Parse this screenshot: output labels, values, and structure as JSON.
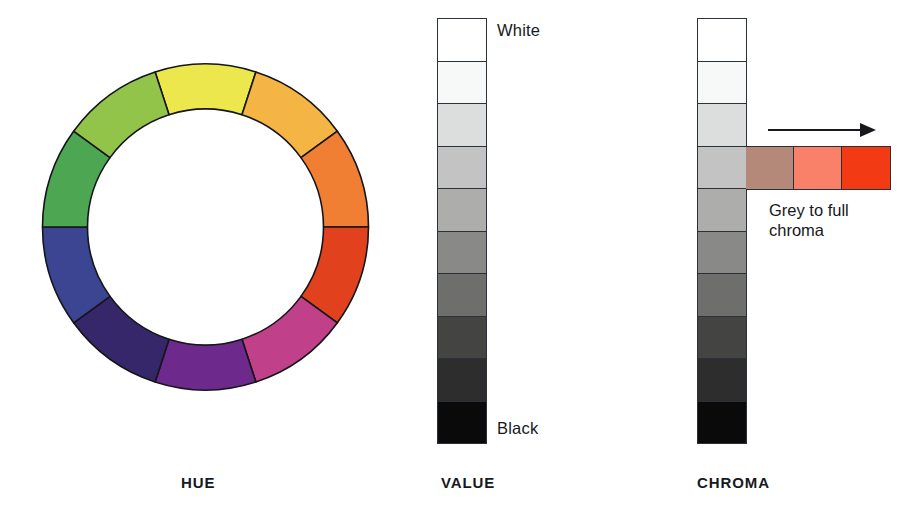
{
  "figure": {
    "panels": [
      {
        "key": "hue",
        "label": "HUE"
      },
      {
        "key": "value",
        "label": "VALUE"
      },
      {
        "key": "chroma",
        "label": "CHROMA"
      }
    ]
  },
  "hue": {
    "label": "HUE",
    "segment_count": 10,
    "outer_radius": 163,
    "inner_radius": 118,
    "stroke": "#15161a",
    "segments": [
      {
        "name": "yellow",
        "color": "#ece74c",
        "start_deg": -18,
        "end_deg": 18
      },
      {
        "name": "yellow-orange",
        "color": "#f5b545",
        "start_deg": 18,
        "end_deg": 54
      },
      {
        "name": "orange",
        "color": "#f07f34",
        "start_deg": 54,
        "end_deg": 90
      },
      {
        "name": "red-orange",
        "color": "#e2411d",
        "start_deg": 90,
        "end_deg": 126
      },
      {
        "name": "magenta",
        "color": "#c0408a",
        "start_deg": 126,
        "end_deg": 162
      },
      {
        "name": "violet",
        "color": "#6d2a8c",
        "start_deg": 162,
        "end_deg": 198
      },
      {
        "name": "blue-violet",
        "color": "#352769",
        "start_deg": 198,
        "end_deg": 234
      },
      {
        "name": "blue",
        "color": "#3b4591",
        "start_deg": 234,
        "end_deg": 270
      },
      {
        "name": "green",
        "color": "#4da651",
        "start_deg": 270,
        "end_deg": 306
      },
      {
        "name": "yellow-green",
        "color": "#92c44a",
        "start_deg": 306,
        "end_deg": 342
      }
    ]
  },
  "value": {
    "label": "VALUE",
    "top_label": "White",
    "bottom_label": "Black",
    "step_count": 10,
    "steps": [
      {
        "name": "step-1-white",
        "color": "#ffffff"
      },
      {
        "name": "step-2",
        "color": "#f7f8f8"
      },
      {
        "name": "step-3",
        "color": "#dcdddd"
      },
      {
        "name": "step-4",
        "color": "#c2c3c2"
      },
      {
        "name": "step-5",
        "color": "#adaeac"
      },
      {
        "name": "step-6",
        "color": "#898a88"
      },
      {
        "name": "step-7",
        "color": "#6e6f6d"
      },
      {
        "name": "step-8",
        "color": "#444543"
      },
      {
        "name": "step-9",
        "color": "#2c2d2c"
      },
      {
        "name": "step-10-black",
        "color": "#0a0a0a"
      }
    ]
  },
  "chroma": {
    "label": "CHROMA",
    "caption": "Grey to full chroma",
    "arrow": "right-arrow",
    "step_count": 10,
    "strip_row_index": 4,
    "steps": [
      {
        "name": "step-1-white",
        "color": "#ffffff"
      },
      {
        "name": "step-2",
        "color": "#f7f8f8"
      },
      {
        "name": "step-3",
        "color": "#dcdddd"
      },
      {
        "name": "step-4",
        "color": "#c2c3c2"
      },
      {
        "name": "step-5",
        "color": "#adaeac"
      },
      {
        "name": "step-6",
        "color": "#898a88"
      },
      {
        "name": "step-7",
        "color": "#6e6f6d"
      },
      {
        "name": "step-8",
        "color": "#444543"
      },
      {
        "name": "step-9",
        "color": "#2c2d2c"
      },
      {
        "name": "step-10-black",
        "color": "#0a0a0a"
      }
    ],
    "strip": [
      {
        "name": "low-chroma",
        "color": "#b5897a"
      },
      {
        "name": "mid-chroma",
        "color": "#f9816a"
      },
      {
        "name": "full-chroma",
        "color": "#f23a14"
      }
    ]
  }
}
